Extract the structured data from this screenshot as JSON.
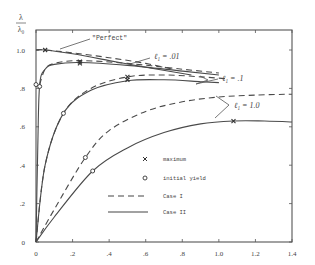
{
  "chart_data": {
    "type": "line",
    "title": "",
    "xlabel": "",
    "ylabel": "λ / λ₀",
    "ylabel_top": "λ",
    "ylabel_bottom": "λ₀",
    "xlim": [
      0,
      1.4
    ],
    "ylim": [
      0,
      1.1
    ],
    "x_ticks": [
      0,
      0.2,
      0.4,
      0.6,
      0.8,
      1.0,
      1.2,
      1.4
    ],
    "x_tick_labels": [
      "0",
      ".2",
      ".4",
      ".6",
      ".8",
      "1.0",
      "1.2",
      "1.4"
    ],
    "y_ticks": [
      0,
      0.2,
      0.4,
      0.6,
      0.8,
      1.0
    ],
    "y_tick_labels": [
      "0",
      ".2",
      ".4",
      ".6",
      ".8",
      "1.0"
    ],
    "grid": false,
    "series": [
      {
        "name": "Perfect, Case I",
        "style": "dashed",
        "x": [
          0,
          0.05,
          0.2,
          0.4,
          0.6,
          0.75
        ],
        "y": [
          1.0,
          1.0,
          0.985,
          0.96,
          0.93,
          0.9
        ]
      },
      {
        "name": "Perfect, Case II",
        "style": "solid",
        "x": [
          0,
          0.05,
          0.2,
          0.4,
          0.6,
          0.85
        ],
        "y": [
          1.0,
          1.0,
          0.98,
          0.945,
          0.91,
          0.87
        ]
      },
      {
        "name": "l1 = .01, Case I",
        "style": "dashed",
        "x": [
          0.02,
          0.05,
          0.1,
          0.24,
          0.5,
          0.8,
          1.0
        ],
        "y": [
          0.82,
          0.9,
          0.93,
          0.945,
          0.93,
          0.9,
          0.88
        ]
      },
      {
        "name": "l1 = .01, Case II",
        "style": "solid",
        "x": [
          0.0,
          0.01,
          0.02,
          0.05,
          0.1,
          0.24,
          0.5,
          0.8,
          1.0
        ],
        "y": [
          0.0,
          0.5,
          0.82,
          0.9,
          0.925,
          0.935,
          0.92,
          0.89,
          0.87
        ]
      },
      {
        "name": "l1 = .1, Case I",
        "style": "dashed",
        "x": [
          0.0,
          0.05,
          0.15,
          0.3,
          0.5,
          0.7,
          0.9,
          1.05
        ],
        "y": [
          0.0,
          0.4,
          0.67,
          0.8,
          0.86,
          0.87,
          0.86,
          0.85
        ]
      },
      {
        "name": "l1 = .1, Case II",
        "style": "solid",
        "x": [
          0.0,
          0.05,
          0.15,
          0.3,
          0.5,
          0.7,
          0.9,
          1.0
        ],
        "y": [
          0.0,
          0.4,
          0.67,
          0.79,
          0.84,
          0.845,
          0.835,
          0.83
        ]
      },
      {
        "name": "l1 = 1.0, Case I",
        "style": "dashed",
        "x": [
          0.0,
          0.1,
          0.27,
          0.4,
          0.6,
          0.8,
          1.0,
          1.2,
          1.4
        ],
        "y": [
          0.0,
          0.17,
          0.44,
          0.58,
          0.68,
          0.73,
          0.755,
          0.765,
          0.77
        ]
      },
      {
        "name": "l1 = 1.0, Case II",
        "style": "solid",
        "x": [
          0.0,
          0.1,
          0.31,
          0.5,
          0.7,
          0.9,
          1.08,
          1.25,
          1.4
        ],
        "y": [
          0.0,
          0.13,
          0.37,
          0.49,
          0.57,
          0.615,
          0.63,
          0.63,
          0.625
        ]
      }
    ],
    "markers": {
      "maximum": [
        {
          "x": 0.05,
          "y": 1.0
        },
        {
          "x": 0.24,
          "y": 0.94
        },
        {
          "x": 0.24,
          "y": 0.93
        },
        {
          "x": 0.5,
          "y": 0.86
        },
        {
          "x": 0.5,
          "y": 0.845
        },
        {
          "x": 1.08,
          "y": 0.63
        }
      ],
      "initial_yield": [
        {
          "x": 0.0,
          "y": 0.82
        },
        {
          "x": 0.02,
          "y": 0.81
        },
        {
          "x": 0.15,
          "y": 0.67
        },
        {
          "x": 0.27,
          "y": 0.44
        },
        {
          "x": 0.31,
          "y": 0.37
        }
      ]
    },
    "annotations": [
      {
        "text": "\"Perfect\"",
        "x": 0.3,
        "y": 1.04
      },
      {
        "text": "ℓ₁ = .01",
        "x": 0.67,
        "y": 0.97
      },
      {
        "text": "ℓ₁ = .1",
        "x": 1.0,
        "y": 0.86
      },
      {
        "text": "ℓ₁ = 1.0",
        "x": 1.1,
        "y": 0.72
      }
    ],
    "legend": {
      "position": "lower right inside",
      "entries": [
        {
          "symbol": "x",
          "label": "maximum"
        },
        {
          "symbol": "o",
          "label": "initial yield"
        },
        {
          "symbol": "dashed",
          "label": "Case I"
        },
        {
          "symbol": "solid",
          "label": "Case II"
        }
      ]
    }
  }
}
